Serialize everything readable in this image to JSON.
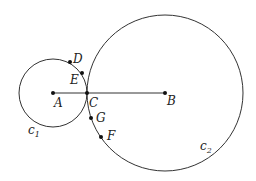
{
  "diagram": {
    "circles": [
      {
        "name": "c1",
        "label": "c",
        "sub": "1",
        "center": "A"
      },
      {
        "name": "c2",
        "label": "c",
        "sub": "2",
        "center": "B"
      }
    ],
    "points": {
      "A": "A",
      "B": "B",
      "C": "C",
      "D": "D",
      "E": "E",
      "F": "F",
      "G": "G"
    },
    "segments": [
      {
        "from": "A",
        "to": "B"
      }
    ],
    "colors": {
      "stroke": "#333333",
      "background": "#ffffff"
    }
  }
}
